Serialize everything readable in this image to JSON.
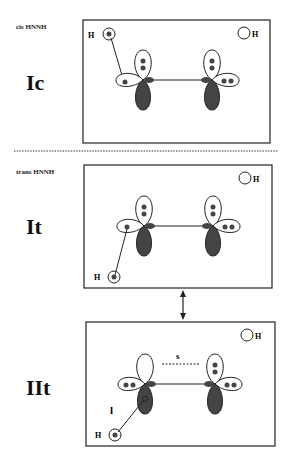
{
  "panels": [
    {
      "caption": "cis HNNH",
      "label": "Ic",
      "proton": "H+",
      "h_label": "H"
    },
    {
      "caption": "trans HNNH",
      "label": "It",
      "proton": "H+",
      "h_label": "H"
    },
    {
      "caption": "",
      "label": "IIt",
      "proton": "H+",
      "h_label": "H",
      "annotation_s": "s",
      "annotation_l": "l"
    }
  ],
  "colors": {
    "lobe_filled": "#444444",
    "line": "#222222",
    "background": "#ffffff"
  }
}
